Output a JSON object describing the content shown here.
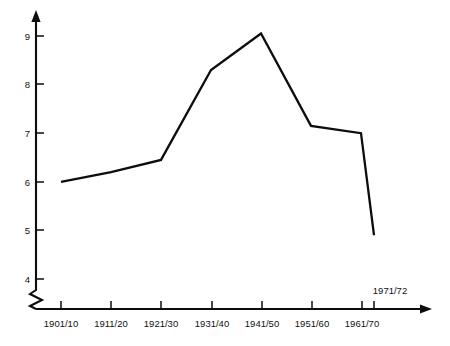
{
  "chart_data": {
    "type": "line",
    "title": "",
    "subtitle": "",
    "xlabel": "",
    "ylabel": "",
    "categories": [
      "1901/10",
      "1911/20",
      "1921/30",
      "1931/40",
      "1941/50",
      "1951/60",
      "1961/70",
      "1971/72"
    ],
    "values": [
      6.0,
      6.2,
      6.45,
      8.3,
      9.05,
      7.15,
      7.0,
      4.9
    ],
    "series": [
      {
        "name": "",
        "values": [
          6.0,
          6.2,
          6.45,
          8.3,
          9.05,
          7.15,
          7.0,
          4.9
        ]
      }
    ],
    "ylim": [
      4,
      9.4
    ],
    "y_ticks": [
      "4",
      "5",
      "6",
      "7",
      "8",
      "9"
    ],
    "y_tick_values": [
      4,
      5,
      6,
      7,
      8,
      9
    ],
    "x_ticks": [
      "1901/10",
      "1911/20",
      "1921/30",
      "1931/40",
      "1941/50",
      "1951/60",
      "1961/70"
    ],
    "extra_x_tick": "1971/72",
    "axis_break": true,
    "grid": false,
    "legend": "none",
    "line_color": "#0d0d0d",
    "axis_color": "#0d0d0d",
    "background": "#ffffff"
  },
  "axes": {
    "y_tick_labels": [
      "9",
      "8",
      "7",
      "6",
      "5",
      "4"
    ],
    "x_tick_labels": [
      "1901/10",
      "1911/20",
      "1921/30",
      "1931/40",
      "1941/50",
      "1951/60",
      "1961/70"
    ],
    "above_axis_label": "1971/72"
  },
  "icons": {
    "y_axis_arrow": "arrow-up-icon",
    "x_axis_arrow": "arrow-right-icon",
    "axis_break": "axis-break-zigzag-icon"
  }
}
